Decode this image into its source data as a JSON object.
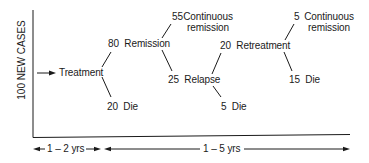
{
  "diagram": {
    "y_axis_label": "100 NEW CASES",
    "nodes": {
      "treatment": {
        "label": "Treatment"
      },
      "remission": {
        "count": "80",
        "label": "Remission"
      },
      "die_initial": {
        "count": "20",
        "label": "Die"
      },
      "continuous_remission_1": {
        "count": "55",
        "line1": "Continuous",
        "line2": "remission"
      },
      "relapse": {
        "count": "25",
        "label": "Relapse"
      },
      "retreatment": {
        "count": "20",
        "label": "Retreatment"
      },
      "die_relapse": {
        "count": "5",
        "label": "Die"
      },
      "continuous_remission_2": {
        "count": "5",
        "line1": "Continuous",
        "line2": "remission"
      },
      "die_retreatment": {
        "count": "15",
        "label": "Die"
      }
    },
    "timeline": {
      "phase1": "1 – 2 yrs",
      "phase2": "1 – 5 yrs"
    },
    "colors": {
      "ink": "#1a1a1a",
      "background": "#ffffff"
    }
  }
}
